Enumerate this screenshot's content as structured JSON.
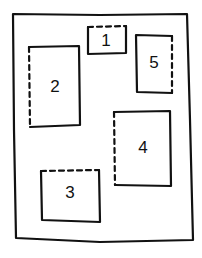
{
  "diagram": {
    "stroke_color": "#111111",
    "background_color": "#ffffff",
    "boxes": [
      {
        "id": "box-1",
        "label": "1",
        "dashed_edge": "top"
      },
      {
        "id": "box-2",
        "label": "2",
        "dashed_edge": "left"
      },
      {
        "id": "box-3",
        "label": "3",
        "dashed_edge": "top"
      },
      {
        "id": "box-4",
        "label": "4",
        "dashed_edge": "left"
      },
      {
        "id": "box-5",
        "label": "5",
        "dashed_edge": "right"
      }
    ]
  }
}
